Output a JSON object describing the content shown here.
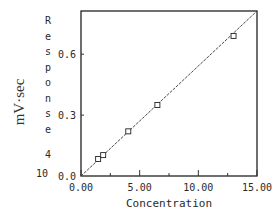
{
  "chart_data": {
    "type": "scatter",
    "title": "",
    "xlabel": "Concentration",
    "ylabel": "Response",
    "ylabel_stacked_chars": [
      "R",
      "e",
      "s",
      "p",
      "o",
      "n",
      "s",
      "e"
    ],
    "ylabel_exponent_note": "4",
    "ylabel_exponent_base": "10",
    "ylabel_units": "mV·sec",
    "xlim": [
      0,
      15
    ],
    "ylim": [
      0,
      0.81
    ],
    "x_ticks": [
      "0.00",
      "5.00",
      "10.00",
      "15.00"
    ],
    "x_tick_values": [
      0,
      5,
      10,
      15
    ],
    "x_minor_ticks": [
      2.5,
      7.5,
      12.5
    ],
    "y_ticks": [
      "0.0",
      "0.3",
      "0.6"
    ],
    "y_tick_values": [
      0.0,
      0.3,
      0.6
    ],
    "grid": false,
    "legend": null,
    "series": [
      {
        "name": "data",
        "marker": "square",
        "x": [
          1.46,
          1.89,
          4.03,
          6.51,
          13.0
        ],
        "y": [
          0.084,
          0.103,
          0.22,
          0.35,
          0.69
        ]
      },
      {
        "name": "fit",
        "style": "line",
        "x": [
          0,
          15
        ],
        "y": [
          0,
          0.83
        ]
      }
    ]
  }
}
